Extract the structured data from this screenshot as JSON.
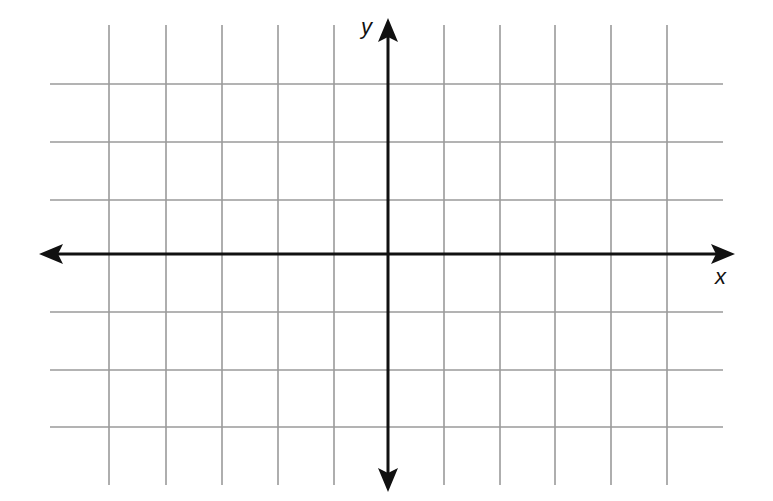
{
  "diagram": {
    "type": "coordinate-plane",
    "axes": {
      "x_label": "x",
      "y_label": "y",
      "x_arrows": [
        "left",
        "right"
      ],
      "y_arrows": [
        "up",
        "down"
      ]
    },
    "grid": {
      "columns_left_of_y_axis": 6,
      "columns_right_of_y_axis": 6,
      "rows_above_x_axis": 3,
      "rows_below_x_axis": 3,
      "tick_labels": "none"
    },
    "colors": {
      "grid": "#9a9a9a",
      "axes": "#111111",
      "background": "#ffffff"
    },
    "geometry": {
      "origin_px": [
        388,
        254
      ],
      "vertical_grid_x": [
        109,
        166,
        222,
        278,
        334,
        444,
        500,
        555,
        611,
        667
      ],
      "horizontal_grid_y": [
        84,
        142,
        200,
        312,
        370,
        427
      ],
      "grid_vertical_span": [
        25,
        485
      ],
      "grid_horizontal_span": [
        50,
        723
      ],
      "x_axis_span": [
        39,
        735
      ],
      "y_axis_span": [
        18,
        492
      ]
    }
  }
}
